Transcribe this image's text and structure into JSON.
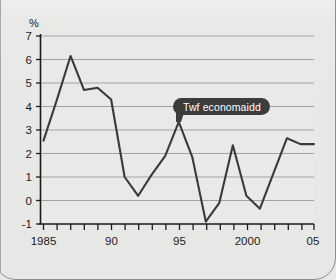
{
  "chart_data": {
    "type": "line",
    "title": "",
    "subtitle": "",
    "xlabel": "",
    "ylabel": "%",
    "unit_label": "%",
    "xlim": [
      1985,
      2005
    ],
    "ylim": [
      -1,
      7
    ],
    "grid": true,
    "legend_position": "none",
    "x_tick_labels": [
      "1985",
      "90",
      "95",
      "2000",
      "05"
    ],
    "x_tick_values": [
      1985,
      1990,
      1995,
      2000,
      2005
    ],
    "y_tick_labels": [
      "7",
      "6",
      "5",
      "4",
      "3",
      "2",
      "1",
      "0",
      "-1"
    ],
    "y_tick_values": [
      7,
      6,
      5,
      4,
      3,
      2,
      1,
      0,
      -1
    ],
    "x": [
      1985,
      1986,
      1987,
      1988,
      1989,
      1990,
      1991,
      1992,
      1993,
      1994,
      1995,
      1996,
      1997,
      1998,
      1999,
      2000,
      2001,
      2002,
      2003,
      2004,
      2005
    ],
    "series": [
      {
        "name": "Twf economaidd",
        "color": "#3a3a3a",
        "values": [
          2.55,
          4.3,
          6.15,
          4.7,
          4.8,
          4.3,
          1.0,
          0.2,
          1.1,
          1.9,
          3.35,
          1.85,
          -0.9,
          -0.1,
          2.35,
          0.2,
          -0.35,
          1.15,
          2.65,
          2.4,
          2.4
        ]
      }
    ],
    "annotations": [
      {
        "label": "Twf economaidd",
        "x": 1996,
        "y": 3.35,
        "style": "dark-callout"
      }
    ]
  },
  "callout": {
    "label": "Twf economaidd"
  },
  "axes": {
    "y_unit": "%"
  }
}
